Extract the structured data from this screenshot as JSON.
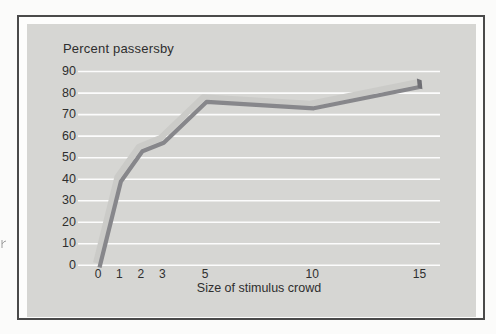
{
  "chart_data": {
    "type": "line",
    "ylabel": "Percent passersby",
    "xlabel": "Size of stimulus crowd",
    "x": [
      0,
      1,
      2,
      3,
      5,
      10,
      15
    ],
    "values": [
      0,
      40,
      54,
      58,
      77,
      74,
      84
    ],
    "x_ticks": [
      0,
      1,
      2,
      3,
      5,
      10,
      15
    ],
    "y_ticks": [
      0,
      10,
      20,
      30,
      40,
      50,
      60,
      70,
      80,
      90
    ],
    "xlim": [
      0,
      15
    ],
    "ylim": [
      0,
      90
    ],
    "grid": "horizontal-white-lines",
    "legend": "none",
    "line_style": "thick 3d gray ribbon",
    "colors": {
      "page_bg": "#fbfbfa",
      "figure_border": "#4a4a4a",
      "figure_bg": "#fdfdfc",
      "panel_bg": "#d6d6d3",
      "gridline": "#fcfcfc",
      "ribbon_top": "#cbcbc8",
      "ribbon_front": "#87878b",
      "ribbon_end": "#6f6f74",
      "text": "#2e2e2e"
    }
  }
}
